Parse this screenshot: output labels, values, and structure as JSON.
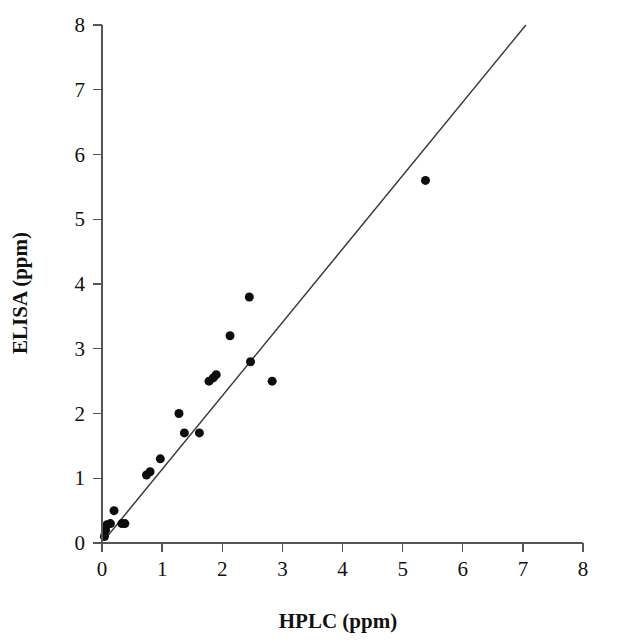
{
  "chart_data": {
    "type": "scatter",
    "title": "",
    "xlabel": "HPLC (ppm)",
    "ylabel": "ELISA (ppm)",
    "xlim": [
      0,
      8
    ],
    "ylim": [
      0,
      8
    ],
    "xticks": [
      "0",
      "1",
      "2",
      "3",
      "4",
      "5",
      "6",
      "7",
      "8"
    ],
    "yticks": [
      "0",
      "1",
      "2",
      "3",
      "4",
      "5",
      "6",
      "7",
      "8"
    ],
    "xtick_values": [
      0,
      1,
      2,
      3,
      4,
      5,
      6,
      7,
      8
    ],
    "ytick_values": [
      0,
      1,
      2,
      3,
      4,
      5,
      6,
      7,
      8
    ],
    "grid": false,
    "legend": "none",
    "marker": "filled-circle",
    "marker_color": "#0d0d0d",
    "marker_size_px": 9,
    "line_color": "#3a3a3a",
    "series": [
      {
        "name": "ELISA vs HPLC",
        "points": [
          [
            0.04,
            0.1
          ],
          [
            0.06,
            0.2
          ],
          [
            0.08,
            0.28
          ],
          [
            0.14,
            0.3
          ],
          [
            0.2,
            0.5
          ],
          [
            0.33,
            0.3
          ],
          [
            0.38,
            0.3
          ],
          [
            0.74,
            1.05
          ],
          [
            0.8,
            1.1
          ],
          [
            0.97,
            1.3
          ],
          [
            1.28,
            2.0
          ],
          [
            1.37,
            1.7
          ],
          [
            1.62,
            1.7
          ],
          [
            1.78,
            2.5
          ],
          [
            1.85,
            2.55
          ],
          [
            1.9,
            2.6
          ],
          [
            2.13,
            3.2
          ],
          [
            2.45,
            3.8
          ],
          [
            2.47,
            2.8
          ],
          [
            2.83,
            2.5
          ],
          [
            5.38,
            5.6
          ]
        ]
      }
    ],
    "fit_line": {
      "name": "regression-line",
      "x_start": 0.05,
      "y_start": 0.06,
      "x_end": 7.05,
      "y_end": 8.0,
      "slope": 1.134,
      "intercept": 0.003
    }
  },
  "axes": {
    "x_axis_name": "x-axis",
    "y_axis_name": "y-axis"
  }
}
